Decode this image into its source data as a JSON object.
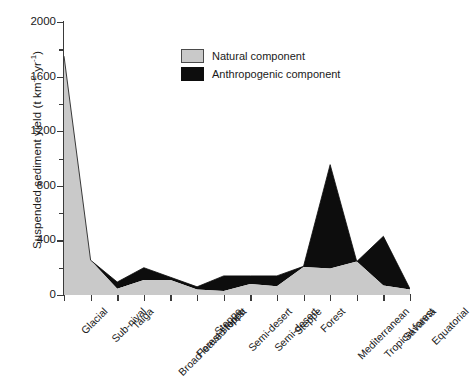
{
  "chart_data": {
    "type": "area",
    "title": "",
    "subtitle": "",
    "xlabel": "",
    "ylabel": "Suspended sediment yield (t km-2 yr-1)",
    "ylabel_parts": {
      "main": "Suspended sediment yield (t km",
      "sup1": "-2",
      "mid": " yr",
      "sup2": "-1",
      "tail": ")"
    },
    "ylim": [
      0,
      2000
    ],
    "ytick_values": [
      0,
      400,
      800,
      1200,
      1600,
      2000
    ],
    "ytick_labels": [
      "0",
      "400",
      "800",
      "1200",
      "1600",
      "2000"
    ],
    "yminor_values": [
      200,
      600,
      1000,
      1400,
      1800
    ],
    "grid": false,
    "stacked": true,
    "legend_position": "upper-center",
    "categories": [
      "Glacial",
      "Sub-nival",
      "Taiga",
      "Broad leaved forest",
      "Forest steppe",
      "Steppe",
      "Semi-desert",
      "Semi-desert",
      "Steppe",
      "Forest",
      "Mediterranean",
      "Tropical forest",
      "Savanna",
      "Equatorial"
    ],
    "series": [
      {
        "name": "Natural component",
        "color": "#c9c9c9",
        "values": [
          1750,
          255,
          45,
          110,
          110,
          40,
          30,
          80,
          65,
          205,
          195,
          245,
          70,
          40
        ]
      },
      {
        "name": "Anthropogenic component",
        "color": "#0d0d0d",
        "values": [
          0,
          0,
          50,
          90,
          20,
          20,
          110,
          60,
          75,
          5,
          760,
          0,
          360,
          5
        ]
      }
    ],
    "totals": [
      1750,
      255,
      95,
      200,
      130,
      60,
      140,
      140,
      140,
      210,
      955,
      245,
      430,
      45
    ]
  },
  "legend": {
    "items": [
      {
        "label": "Natural component",
        "swatch": "natural"
      },
      {
        "label": "Anthropogenic component",
        "swatch": "anthro"
      }
    ]
  },
  "colors": {
    "natural": "#c9c9c9",
    "anthropogenic": "#0d0d0d",
    "axis": "#3a3a3a",
    "text": "#1a1a1a",
    "background": "#ffffff"
  }
}
